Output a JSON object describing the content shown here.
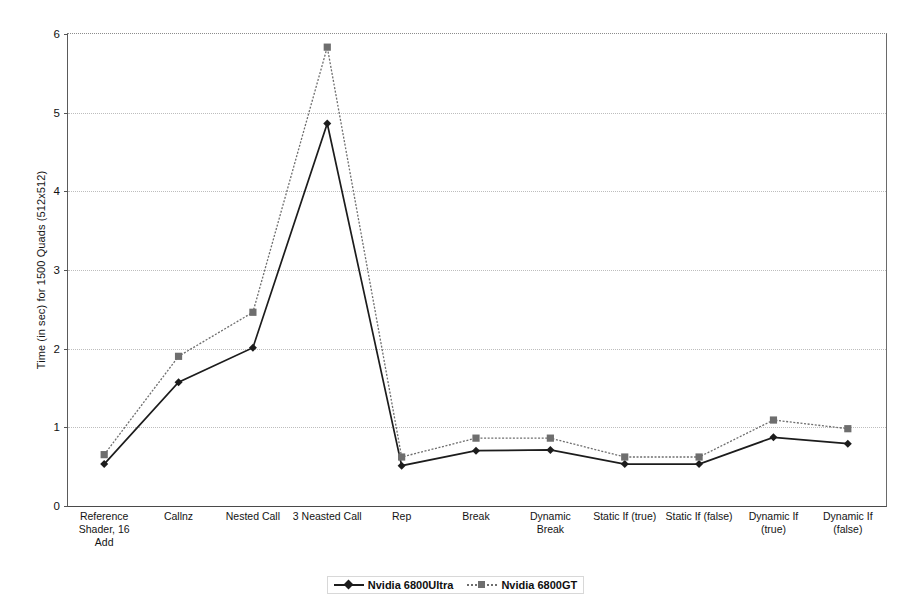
{
  "chart_data": {
    "type": "line",
    "title": "",
    "xlabel": "",
    "ylabel": "Time (in sec) for 1500 Quads (512x512)",
    "ylim": [
      0,
      6
    ],
    "yticks": [
      0,
      1,
      2,
      3,
      4,
      5,
      6
    ],
    "ytick_labels": [
      "0",
      "1",
      "2",
      "3",
      "4",
      "5",
      "6"
    ],
    "grid": true,
    "legend_position": "bottom-center",
    "categories": [
      "Reference Shader, 16 Add",
      "Callnz",
      "Nested Call",
      "3 Neasted Call",
      "Rep",
      "Break",
      "Dynamic Break",
      "Static If (true)",
      "Static If (false)",
      "Dynamic If (true)",
      "Dynamic If (false)"
    ],
    "category_lines": [
      [
        "Reference",
        "Shader, 16",
        "Add"
      ],
      [
        "Callnz"
      ],
      [
        "Nested Call"
      ],
      [
        "3 Neasted Call"
      ],
      [
        "Rep"
      ],
      [
        "Break"
      ],
      [
        "Dynamic",
        "Break"
      ],
      [
        "Static If (true)"
      ],
      [
        "Static If (false)"
      ],
      [
        "Dynamic If",
        "(true)"
      ],
      [
        "Dynamic If",
        "(false)"
      ]
    ],
    "series": [
      {
        "name": "Nvidia 6800Ultra",
        "marker": "diamond",
        "color": "#1c1c1c",
        "linestyle": "solid",
        "values": [
          0.52,
          1.56,
          2.0,
          4.85,
          0.5,
          0.69,
          0.7,
          0.52,
          0.52,
          0.86,
          0.78
        ]
      },
      {
        "name": "Nvidia 6800GT",
        "marker": "square",
        "color": "#6e6e6e",
        "linestyle": "dotted",
        "values": [
          0.64,
          1.89,
          2.45,
          5.82,
          0.61,
          0.85,
          0.85,
          0.61,
          0.61,
          1.08,
          0.97
        ]
      }
    ]
  },
  "legend": {
    "entries": [
      {
        "label": "Nvidia 6800Ultra"
      },
      {
        "label": "Nvidia 6800GT"
      }
    ]
  }
}
